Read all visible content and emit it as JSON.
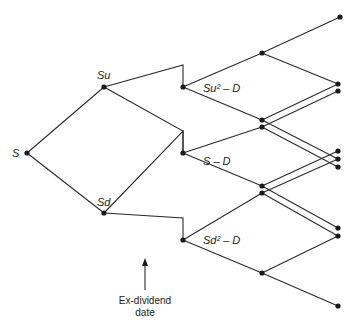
{
  "diagram": {
    "type": "binomial-tree",
    "labels": {
      "root": "S",
      "up": "Su",
      "down": "Sd",
      "upup_minus_div": "Su² – D",
      "mid_minus_div": "S – D",
      "downdown_minus_div": "Sd² – D"
    },
    "annotation": {
      "line1": "Ex-dividend",
      "line2": "date"
    },
    "colors": {
      "line": "#2a2a2a",
      "node": "#1a1a1a",
      "text": "#222222"
    }
  }
}
